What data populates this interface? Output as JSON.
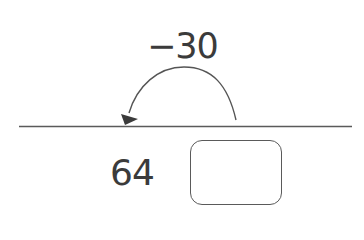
{
  "diagram": {
    "type": "number-line-jump",
    "jump": {
      "label": "−30",
      "direction": "left"
    },
    "start_value": "64",
    "answer_box": {
      "value": ""
    },
    "colors": {
      "text": "#3b3b3b",
      "line": "#5a5a5a",
      "arrowhead": "#3b3b3b"
    }
  }
}
